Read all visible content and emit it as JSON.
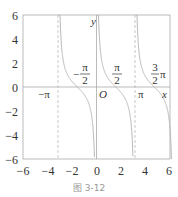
{
  "chart_data": {
    "type": "line",
    "function": "y = cot x",
    "title": "",
    "caption": "图 3-12",
    "xlabel": "x",
    "ylabel": "y",
    "xlim": [
      -6,
      6
    ],
    "ylim": [
      -6,
      6
    ],
    "grid": false,
    "x_ticks": [
      -6,
      -4,
      -2,
      0,
      2,
      4,
      6
    ],
    "x_tick_labels": [
      "−6",
      "−4",
      "−2",
      "0",
      "2",
      "4",
      "6"
    ],
    "y_ticks": [
      6,
      4,
      2,
      0,
      -2,
      -4,
      -6
    ],
    "y_tick_labels": [
      "6",
      "4",
      "2",
      "0",
      "−2",
      "−4",
      "−6"
    ],
    "asymptotes": [
      -3.14159,
      3.14159
    ],
    "asymptote_style": "dashed",
    "branches": [
      {
        "domain": [
          -3.1,
          -0.17
        ],
        "label": "branch between −π and 0"
      },
      {
        "domain": [
          0.05,
          2.97
        ],
        "label": "branch between 0 and π"
      },
      {
        "domain": [
          3.19,
          6.12
        ],
        "label": "branch between π and 2π"
      }
    ],
    "sample_points": [
      {
        "x": -2.36,
        "y": 1.0
      },
      {
        "x": -1.5708,
        "y": 0.0
      },
      {
        "x": -0.785,
        "y": -1.0
      },
      {
        "x": 0.785,
        "y": 1.0
      },
      {
        "x": 1.5708,
        "y": 0.0
      },
      {
        "x": 2.356,
        "y": -1.0
      },
      {
        "x": 3.927,
        "y": 1.0
      },
      {
        "x": 4.712,
        "y": 0.0
      },
      {
        "x": 5.498,
        "y": -1.0
      }
    ],
    "annotations": {
      "neg_half_pi": {
        "sign": "−",
        "num": "π",
        "den": "2"
      },
      "half_pi": {
        "num": "π",
        "den": "2"
      },
      "three_half_pi": {
        "num": "3",
        "den": "2",
        "suffix": "π"
      },
      "neg_pi": "−π",
      "origin": "O",
      "pi": "π",
      "x_axis": "x",
      "y_axis": "y"
    },
    "colors": {
      "curve": "#b8b8b8",
      "axes": "#aaaaaa",
      "frame": "#aaaaaa",
      "asymptote": "#bbbbbb",
      "text": "#333333"
    }
  }
}
